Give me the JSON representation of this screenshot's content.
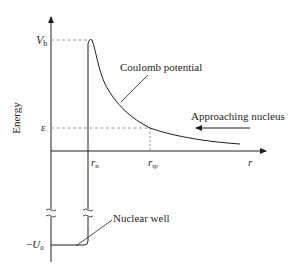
{
  "diagram": {
    "y_axis_label": "Energy",
    "x_axis_label": "r",
    "energy_levels": {
      "barrier_height": {
        "symbol": "V",
        "subscript": "b"
      },
      "particle_energy": {
        "symbol": "ε"
      },
      "well_depth": {
        "prefix": "−",
        "symbol": "U",
        "subscript": "0"
      }
    },
    "radii": {
      "nuclear_radius": {
        "symbol": "r",
        "subscript": "n"
      },
      "turning_point": {
        "symbol": "r",
        "subscript": "tp"
      }
    },
    "annotations": {
      "coulomb": "Coulomb potential",
      "approaching": "Approaching nucleus",
      "well": "Nuclear well"
    },
    "colors": {
      "line": "#231f20",
      "dashed": "#808080"
    }
  }
}
